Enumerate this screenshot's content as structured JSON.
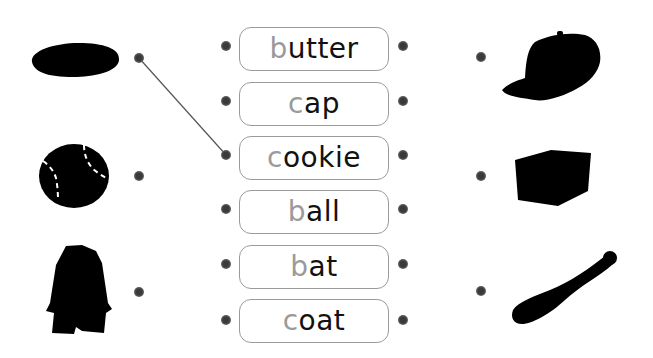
{
  "words": [
    {
      "first": "b",
      "rest": "utter"
    },
    {
      "first": "c",
      "rest": "ap"
    },
    {
      "first": "c",
      "rest": "ookie"
    },
    {
      "first": "b",
      "rest": "all"
    },
    {
      "first": "b",
      "rest": "at"
    },
    {
      "first": "c",
      "rest": "oat"
    }
  ],
  "left_pictures": [
    "cookie-icon",
    "ball-icon",
    "coat-icon"
  ],
  "right_pictures": [
    "cap-icon",
    "butter-icon",
    "bat-icon"
  ],
  "connections": [
    {
      "from": "left-picture-1",
      "to": "word-3-left"
    }
  ],
  "colors": {
    "first_letter": "#9a9a9a",
    "text": "#111111",
    "border": "#9a9a9a",
    "dot": "#3a3a3a",
    "line": "#555555"
  }
}
